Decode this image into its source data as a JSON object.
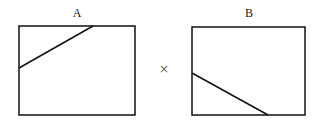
{
  "panels": [
    {
      "label": "A",
      "box": {
        "x": 19,
        "y": 26,
        "w": 116,
        "h": 89
      },
      "line": {
        "x1": 19,
        "y1": 68,
        "x2": 93,
        "y2": 26
      }
    },
    {
      "label": "B",
      "box": {
        "x": 192,
        "y": 27,
        "w": 113,
        "h": 88
      },
      "line": {
        "x1": 192,
        "y1": 73,
        "x2": 268,
        "y2": 115
      }
    }
  ],
  "operator": "×",
  "colors": {
    "stroke": "#111111",
    "operator": "#666666"
  }
}
